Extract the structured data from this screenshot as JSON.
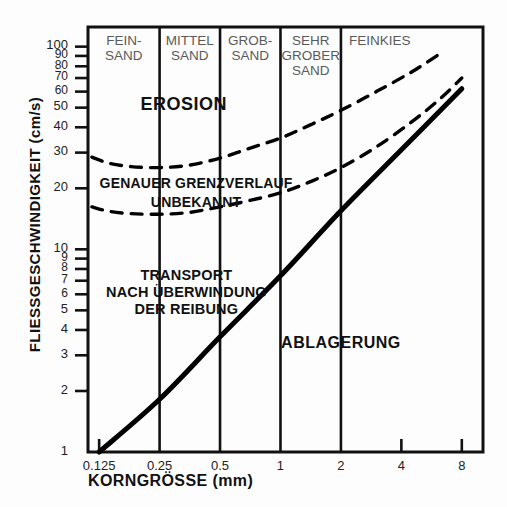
{
  "chart_data": {
    "type": "line",
    "title": "",
    "xlabel": "KORNGRÖSSE (mm)",
    "ylabel": "FLIESSGESCHWINDIGKEIT (cm/s)",
    "xscale": "log",
    "yscale": "log",
    "xlim": [
      0.11,
      10.2
    ],
    "ylim": [
      1,
      125
    ],
    "grid": "vertical category dividers only",
    "legend": "none",
    "xticks": [
      {
        "value": 0.125,
        "label": "0.125"
      },
      {
        "value": 0.25,
        "label": "0.25"
      },
      {
        "value": 0.5,
        "label": "0.5"
      },
      {
        "value": 1,
        "label": "1"
      },
      {
        "value": 2,
        "label": "2"
      },
      {
        "value": 4,
        "label": "4"
      },
      {
        "value": 8,
        "label": "8"
      }
    ],
    "yticks": [
      {
        "value": 1,
        "label": "1"
      },
      {
        "value": 2,
        "label": "2"
      },
      {
        "value": 3,
        "label": "3"
      },
      {
        "value": 4,
        "label": "4"
      },
      {
        "value": 5,
        "label": "5"
      },
      {
        "value": 6,
        "label": "6"
      },
      {
        "value": 7,
        "label": "7"
      },
      {
        "value": 8,
        "label": "8"
      },
      {
        "value": 9,
        "label": "9"
      },
      {
        "value": 10,
        "label": "10"
      },
      {
        "value": 20,
        "label": "20"
      },
      {
        "value": 30,
        "label": "30"
      },
      {
        "value": 40,
        "label": "40"
      },
      {
        "value": 50,
        "label": "50"
      },
      {
        "value": 60,
        "label": "60"
      },
      {
        "value": 70,
        "label": "70"
      },
      {
        "value": 80,
        "label": "80"
      },
      {
        "value": 90,
        "label": "90"
      },
      {
        "value": 100,
        "label": "100"
      }
    ],
    "category_dividers": [
      0.25,
      0.5,
      1,
      2
    ],
    "categories": [
      {
        "label": "FEIN-\nSAND",
        "from": 0.11,
        "to": 0.25
      },
      {
        "label": "MITTEL\nSAND",
        "from": 0.25,
        "to": 0.5
      },
      {
        "label": "GROB-\nSAND",
        "from": 0.5,
        "to": 1
      },
      {
        "label": "SEHR\nGROBER\nSAND",
        "from": 1,
        "to": 2
      },
      {
        "label": "FEINKIES",
        "from": 2,
        "to": 10.2
      }
    ],
    "series": [
      {
        "name": "upper erosion boundary (dashed)",
        "style": "dashed",
        "color": "#000000",
        "points": [
          [
            0.115,
            28.5
          ],
          [
            0.14,
            26.6
          ],
          [
            0.18,
            25.6
          ],
          [
            0.25,
            25.3
          ],
          [
            0.35,
            26.0
          ],
          [
            0.5,
            28.2
          ],
          [
            0.7,
            31.5
          ],
          [
            1.0,
            35.4
          ],
          [
            1.4,
            41.0
          ],
          [
            2.0,
            48.5
          ],
          [
            3.0,
            60.0
          ],
          [
            4.5,
            75.0
          ],
          [
            6.2,
            92.0
          ]
        ]
      },
      {
        "name": "lower erosion boundary (dashed)",
        "style": "dashed",
        "color": "#000000",
        "points": [
          [
            0.115,
            16.2
          ],
          [
            0.14,
            15.4
          ],
          [
            0.18,
            15.0
          ],
          [
            0.25,
            14.9
          ],
          [
            0.35,
            15.2
          ],
          [
            0.5,
            16.2
          ],
          [
            0.7,
            17.4
          ],
          [
            1.0,
            19.0
          ],
          [
            1.4,
            21.5
          ],
          [
            2.0,
            25.3
          ],
          [
            3.0,
            32.0
          ],
          [
            4.5,
            42.5
          ],
          [
            6.2,
            55.0
          ],
          [
            8.0,
            70.0
          ]
        ]
      },
      {
        "name": "transport / deposition boundary (solid)",
        "style": "solid",
        "color": "#000000",
        "points": [
          [
            0.125,
            1.0
          ],
          [
            0.25,
            1.82
          ],
          [
            0.5,
            3.7
          ],
          [
            1.0,
            7.4
          ],
          [
            2.0,
            15.5
          ],
          [
            4.0,
            31.0
          ],
          [
            8.0,
            62.0
          ]
        ]
      }
    ],
    "annotations": [
      {
        "name": "erosion",
        "text": "EROSION",
        "x": 0.33,
        "y": 52
      },
      {
        "name": "boundary-unknown",
        "text": "GENAUER GRENZVERLAUF\nUNBEKANNT",
        "x": 0.38,
        "y": 21
      },
      {
        "name": "transport",
        "text": "TRANSPORT\nNACH ÜBERWINDUNG\nDER REIBUNG",
        "x": 0.34,
        "y": 7.3
      },
      {
        "name": "deposition",
        "text": "ABLAGERUNG",
        "x": 2.0,
        "y": 3.4
      }
    ]
  },
  "colors": {
    "line": "#000000",
    "frame": "#111111",
    "divider": "#111111",
    "category_text": "#5a5a5a",
    "tick_text": "#222222",
    "background": "#fdfdfd"
  }
}
